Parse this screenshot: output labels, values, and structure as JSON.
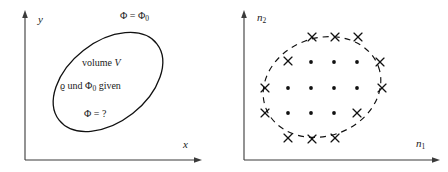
{
  "figure": {
    "background_color": "#ffffff",
    "ink_color": "#111111",
    "axis_color": "#3a3a3a"
  },
  "panels": [
    {
      "id": "left",
      "name": "continuum-domain-panel",
      "axes": {
        "x_label": "x",
        "y_label": "y",
        "x_label_sub": "",
        "y_label_sub": ""
      },
      "boundary": {
        "style": "solid",
        "shape": "rotated-ellipse",
        "cx": 108,
        "cy": 82,
        "rx": 62,
        "ry": 40,
        "rotation_deg": -38
      },
      "labels": [
        {
          "name": "boundary-potential-label",
          "text_main": "Φ = Φ",
          "text_sub": "0",
          "x": 120,
          "y": 16
        },
        {
          "name": "volume-label",
          "text_main": "volume ",
          "text_italic": "V",
          "text_sub": "",
          "x": 82,
          "y": 62
        },
        {
          "name": "given-data-label",
          "text_main": "ϱ und Φ",
          "text_sub": "0",
          "text_tail": " given",
          "x": 62,
          "y": 85
        },
        {
          "name": "unknown-potential-label",
          "text_main": "Φ = ?",
          "text_sub": "",
          "x": 84,
          "y": 113
        }
      ]
    },
    {
      "id": "right",
      "name": "discrete-lattice-panel",
      "axes": {
        "x_label": "n",
        "x_label_sub": "1",
        "y_label": "n",
        "y_label_sub": "2"
      },
      "boundary": {
        "style": "dashed",
        "shape": "rotated-ellipse",
        "cx": 98,
        "cy": 85,
        "rx": 60,
        "ry": 48,
        "rotation_deg": -22
      },
      "lattice": {
        "legend": {
          "interior_marker": "dot",
          "boundary_marker": "cross"
        },
        "interior_points": [
          {
            "x": 87,
            "y": 62
          },
          {
            "x": 110,
            "y": 62
          },
          {
            "x": 133,
            "y": 62
          },
          {
            "x": 64,
            "y": 88
          },
          {
            "x": 87,
            "y": 88
          },
          {
            "x": 110,
            "y": 88
          },
          {
            "x": 133,
            "y": 88
          },
          {
            "x": 64,
            "y": 113
          },
          {
            "x": 87,
            "y": 113
          },
          {
            "x": 110,
            "y": 113
          }
        ],
        "boundary_points": [
          {
            "x": 88,
            "y": 37
          },
          {
            "x": 111,
            "y": 37
          },
          {
            "x": 134,
            "y": 37
          },
          {
            "x": 64,
            "y": 61
          },
          {
            "x": 156,
            "y": 62
          },
          {
            "x": 41,
            "y": 88
          },
          {
            "x": 158,
            "y": 88
          },
          {
            "x": 41,
            "y": 113
          },
          {
            "x": 133,
            "y": 113
          },
          {
            "x": 64,
            "y": 138
          },
          {
            "x": 88,
            "y": 139
          },
          {
            "x": 111,
            "y": 138
          }
        ]
      }
    }
  ]
}
